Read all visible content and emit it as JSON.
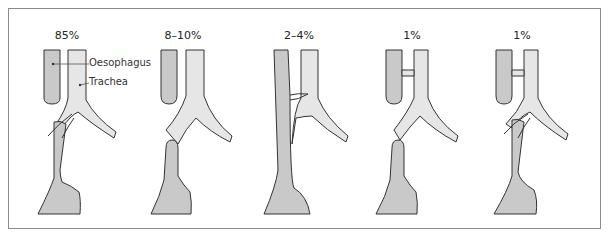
{
  "figure": {
    "colors": {
      "oesophagus_fill": "#c9c9c9",
      "trachea_fill": "#e6e6e6",
      "outline": "#333333",
      "frame": "#8a8a8a"
    },
    "panels": [
      {
        "id": "type-1",
        "frequency": "85%",
        "x_center": 66
      },
      {
        "id": "type-2",
        "frequency": "8–10%",
        "x_center": 183
      },
      {
        "id": "type-3",
        "frequency": "2–4%",
        "x_center": 298
      },
      {
        "id": "type-4",
        "frequency": "1%",
        "x_center": 412
      },
      {
        "id": "type-5",
        "frequency": "1%",
        "x_center": 522
      }
    ],
    "labels": {
      "oesophagus": "Oesophagus",
      "trachea": "Trachea"
    }
  }
}
